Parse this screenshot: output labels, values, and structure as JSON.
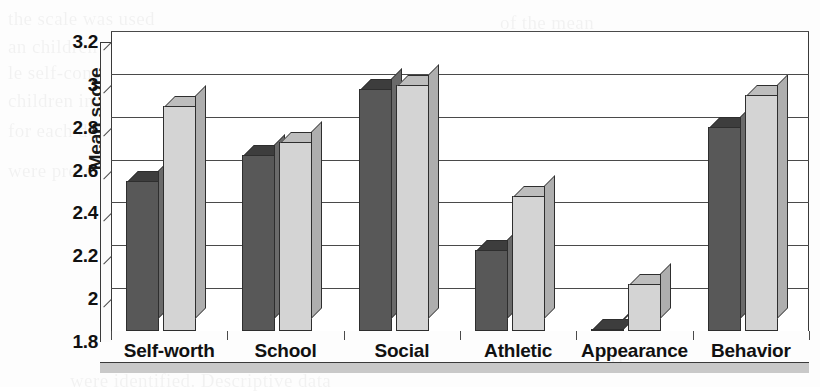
{
  "chart_data": {
    "type": "bar",
    "title": "",
    "xlabel": "",
    "ylabel": "Mean score",
    "ylim": [
      1.8,
      3.2
    ],
    "yticks": [
      "1.8",
      "2",
      "2.2",
      "2.4",
      "2.6",
      "2.8",
      "3",
      "3.2"
    ],
    "ytick_values": [
      1.8,
      2.0,
      2.2,
      2.4,
      2.6,
      2.8,
      3.0,
      3.2
    ],
    "grid": true,
    "legend": "none",
    "categories": [
      "Self-worth",
      "School",
      "Social",
      "Athletic",
      "Appearance",
      "Behavior"
    ],
    "series": [
      {
        "name": "series-1",
        "color": "#585858",
        "values": [
          2.5,
          2.62,
          2.93,
          2.18,
          1.81,
          2.75
        ]
      },
      {
        "name": "series-2",
        "color": "#d4d4d4",
        "values": [
          2.85,
          2.68,
          2.95,
          2.43,
          2.02,
          2.9
        ]
      }
    ]
  },
  "axis": {
    "y_title": "Mean score"
  },
  "ghost_text": [
    {
      "text": "the scale was used",
      "x": 8,
      "y": 8
    },
    {
      "text": "an children were",
      "x": 8,
      "y": 36
    },
    {
      "text": "le self-concept of",
      "x": 8,
      "y": 62
    },
    {
      "text": "children in the",
      "x": 8,
      "y": 90
    },
    {
      "text": "for each domain",
      "x": 8,
      "y": 120
    },
    {
      "text": "were presented",
      "x": 8,
      "y": 160
    },
    {
      "text": "of the mean",
      "x": 500,
      "y": 12
    },
    {
      "text": "comparison between",
      "x": 470,
      "y": 44
    },
    {
      "text": "the groups",
      "x": 520,
      "y": 76
    },
    {
      "text": "and the",
      "x": 560,
      "y": 120
    },
    {
      "text": "were identified. Descriptive data",
      "x": 70,
      "y": 370
    },
    {
      "text": "H",
      "x": 610,
      "y": 352
    }
  ]
}
